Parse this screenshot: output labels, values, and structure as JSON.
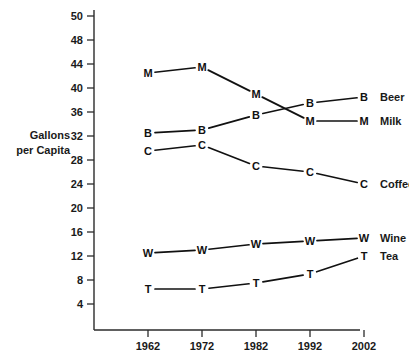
{
  "chart_data": {
    "type": "line",
    "title": "",
    "subtitle": "",
    "xlabel": "",
    "ylabel": "Gallons per Capita",
    "ylabel_lines": [
      "Gallons",
      "per Capita"
    ],
    "x": [
      1962,
      1972,
      1982,
      1992,
      2002
    ],
    "xtick_labels": [
      "1962",
      "1972",
      "1982",
      "1992",
      "2002"
    ],
    "ytick_labels": [
      "50",
      "48",
      "44",
      "40",
      "36",
      "32",
      "28",
      "24",
      "20",
      "16",
      "12",
      "8",
      "4"
    ],
    "ytick_values": [
      50,
      48,
      44,
      40,
      36,
      32,
      28,
      24,
      20,
      16,
      12,
      8,
      4
    ],
    "ylim": [
      2,
      52
    ],
    "grid": false,
    "legend_position": "right-end-of-line",
    "marker_style": "letter",
    "series": [
      {
        "name": "Beer",
        "marker": "B",
        "values": [
          32.5,
          33.0,
          35.5,
          37.5,
          38.5
        ]
      },
      {
        "name": "Milk",
        "marker": "M",
        "values": [
          42.5,
          43.5,
          39.0,
          34.5,
          34.5
        ]
      },
      {
        "name": "Coffee",
        "marker": "C",
        "values": [
          29.5,
          30.5,
          27.0,
          26.0,
          24.0
        ]
      },
      {
        "name": "Wine",
        "marker": "W",
        "values": [
          12.5,
          13.0,
          14.0,
          14.5,
          15.0
        ]
      },
      {
        "name": "Tea",
        "marker": "T",
        "values": [
          6.5,
          6.5,
          7.5,
          9.0,
          12.0
        ]
      }
    ]
  },
  "colors": {
    "background": "#ffffff",
    "ink": "#111111",
    "axis": "#2b2b2b"
  }
}
